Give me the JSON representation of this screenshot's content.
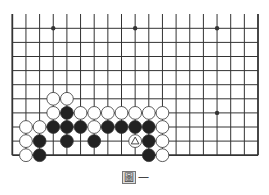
{
  "diagram": {
    "type": "go-board",
    "board_size": 19,
    "visible_rows": 10,
    "grid": {
      "x0": 12.3,
      "dx": 13.65,
      "y0": 28.3,
      "dy": 14.1
    },
    "star_points": [
      [
        3,
        0
      ],
      [
        9,
        0
      ],
      [
        15,
        0
      ],
      [
        15,
        6
      ]
    ],
    "stones": [
      {
        "c": "white",
        "i": 3,
        "j": 5
      },
      {
        "c": "white",
        "i": 4,
        "j": 5
      },
      {
        "c": "white",
        "i": 3,
        "j": 6
      },
      {
        "c": "black",
        "i": 4,
        "j": 6
      },
      {
        "c": "white",
        "i": 5,
        "j": 6
      },
      {
        "c": "white",
        "i": 6,
        "j": 6
      },
      {
        "c": "white",
        "i": 7,
        "j": 6
      },
      {
        "c": "white",
        "i": 8,
        "j": 6
      },
      {
        "c": "white",
        "i": 9,
        "j": 6
      },
      {
        "c": "white",
        "i": 10,
        "j": 6
      },
      {
        "c": "white",
        "i": 11,
        "j": 6
      },
      {
        "c": "white",
        "i": 1,
        "j": 7
      },
      {
        "c": "white",
        "i": 2,
        "j": 7
      },
      {
        "c": "black",
        "i": 3,
        "j": 7
      },
      {
        "c": "black",
        "i": 4,
        "j": 7
      },
      {
        "c": "black",
        "i": 5,
        "j": 7
      },
      {
        "c": "white",
        "i": 6,
        "j": 7
      },
      {
        "c": "black",
        "i": 7,
        "j": 7
      },
      {
        "c": "black",
        "i": 8,
        "j": 7
      },
      {
        "c": "black",
        "i": 9,
        "j": 7
      },
      {
        "c": "black",
        "i": 10,
        "j": 7
      },
      {
        "c": "white",
        "i": 11,
        "j": 7
      },
      {
        "c": "white",
        "i": 1,
        "j": 8
      },
      {
        "c": "black",
        "i": 2,
        "j": 8
      },
      {
        "c": "black",
        "i": 4,
        "j": 8
      },
      {
        "c": "black",
        "i": 6,
        "j": 8
      },
      {
        "c": "white",
        "i": 9,
        "j": 8,
        "mark": "triangle"
      },
      {
        "c": "black",
        "i": 10,
        "j": 8
      },
      {
        "c": "white",
        "i": 11,
        "j": 8
      },
      {
        "c": "white",
        "i": 1,
        "j": 9
      },
      {
        "c": "black",
        "i": 2,
        "j": 9
      },
      {
        "c": "black",
        "i": 10,
        "j": 9
      },
      {
        "c": "white",
        "i": 11,
        "j": 9
      }
    ],
    "colors": {
      "line": "#333333",
      "black_stone": "#222222",
      "white_stone": "#ffffff"
    }
  },
  "caption": {
    "boxed_char": "圖",
    "rest": "一"
  }
}
